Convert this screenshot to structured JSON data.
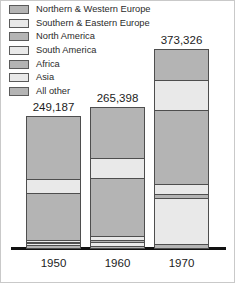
{
  "chart_data": {
    "type": "bar",
    "subtype": "stacked-bar",
    "title": "",
    "subtitle": "",
    "xlabel": "",
    "ylabel": "",
    "grid": false,
    "legend_position": "top-left",
    "categories": [
      "1950",
      "1960",
      "1970"
    ],
    "totals": [
      249187,
      265398,
      373326
    ],
    "total_labels": [
      "249,187",
      "265,398",
      "373,326"
    ],
    "ylim": [
      0,
      373326
    ],
    "series": [
      {
        "name": "Northern & Western Europe",
        "swatch": "#b4b4b4",
        "values": [
          120000,
          96000,
          59000
        ],
        "shares": [
          0.482,
          0.362,
          0.158
        ]
      },
      {
        "name": "Southern & Eastern Europe",
        "swatch": "#e9e9e9",
        "values": [
          27000,
          38000,
          56000
        ],
        "shares": [
          0.108,
          0.143,
          0.15
        ]
      },
      {
        "name": "North America",
        "swatch": "#b4b4b4",
        "values": [
          88000,
          110000,
          140000
        ],
        "shares": [
          0.353,
          0.414,
          0.375
        ]
      },
      {
        "name": "South America",
        "swatch": "#e9e9e9",
        "values": [
          5000,
          9000,
          19000
        ],
        "shares": [
          0.02,
          0.034,
          0.051
        ]
      },
      {
        "name": "Africa",
        "swatch": "#b4b4b4",
        "values": [
          2000,
          3000,
          8000
        ],
        "shares": [
          0.008,
          0.011,
          0.021
        ]
      },
      {
        "name": "Asia",
        "swatch": "#e9e9e9",
        "values": [
          4000,
          7000,
          85000
        ],
        "shares": [
          0.016,
          0.026,
          0.228
        ]
      },
      {
        "name": "All other",
        "swatch": "#b4b4b4",
        "values": [
          3187,
          2398,
          6326
        ],
        "shares": [
          0.013,
          0.01,
          0.017
        ]
      }
    ]
  },
  "legend": {
    "items": [
      {
        "label": "Northern & Western Europe",
        "color": "#b4b4b4"
      },
      {
        "label": "Southern & Eastern Europe",
        "color": "#e9e9e9"
      },
      {
        "label": "North America",
        "color": "#b4b4b4"
      },
      {
        "label": "South America",
        "color": "#e9e9e9"
      },
      {
        "label": "Africa",
        "color": "#b4b4b4"
      },
      {
        "label": "Asia",
        "color": "#e9e9e9"
      },
      {
        "label": "All other",
        "color": "#b4b4b4"
      }
    ]
  },
  "colors": {
    "dark_gray": "#b4b4b4",
    "light_gray": "#e9e9e9",
    "outline": "#4e4e4e",
    "axis": "#111111",
    "text": "#1c1c1c",
    "frame": "#c9c9c9",
    "background": "#ffffff"
  }
}
